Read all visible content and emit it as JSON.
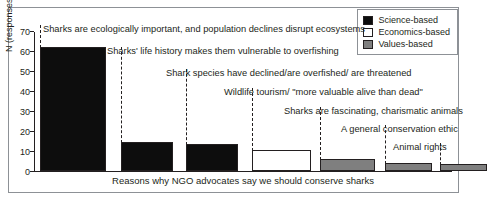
{
  "chart_data": {
    "type": "bar",
    "title": "",
    "xlabel": "Reasons why NGO advocates say we should conserve sharks",
    "ylabel": "N (responses)",
    "ylim": [
      0,
      70
    ],
    "yticks": [
      0,
      10,
      20,
      30,
      40,
      50,
      60,
      70
    ],
    "grid": false,
    "legend_position": "top-right",
    "categories": [
      "Sharks are ecologically important, and population declines disrupt ecosystems",
      "Sharks' life history makes them vulnerable to overfishing",
      "Shark species have declined/are overfished/ are threatened",
      "Wildlife tourism/ \"more valuable alive than dead\"",
      "Sharks are fascinating, charismatic animals",
      "A general conservation ethic",
      "Animal rights"
    ],
    "values": [
      62,
      14.5,
      13.5,
      10.5,
      6,
      4,
      3.5
    ],
    "groups": [
      "Science-based",
      "Science-based",
      "Science-based",
      "Economics-based",
      "Values-based",
      "Values-based",
      "Values-based"
    ],
    "legend": [
      {
        "label": "Science-based",
        "key": "science",
        "color": "#0d0d0d"
      },
      {
        "label": "Economics-based",
        "key": "economics",
        "color": "#ffffff"
      },
      {
        "label": "Values-based",
        "key": "values",
        "color": "#7f7f7f"
      }
    ]
  }
}
